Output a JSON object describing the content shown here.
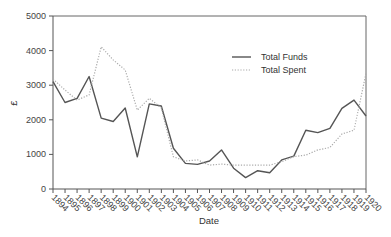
{
  "chart_data": {
    "type": "line",
    "title": "",
    "xlabel": "Date",
    "ylabel": "£",
    "ylim": [
      0,
      5000
    ],
    "yticks": [
      0,
      1000,
      2000,
      3000,
      4000,
      5000
    ],
    "grid": false,
    "legend_position": "upper right (inside)",
    "x": [
      "1894",
      "1895",
      "1896",
      "1897",
      "1898",
      "1899",
      "1900",
      "1901",
      "1902",
      "1903",
      "1904",
      "1905",
      "1906",
      "1907",
      "1908",
      "1909",
      "1910",
      "1911",
      "1912",
      "1913",
      "1914",
      "1915",
      "1916",
      "1917",
      "1918",
      "1919",
      "1920"
    ],
    "series": [
      {
        "name": "Total Funds",
        "style": "solid",
        "color": "#555555",
        "values": [
          3100,
          2500,
          2620,
          3250,
          2050,
          1950,
          2340,
          930,
          2460,
          2400,
          1180,
          740,
          710,
          810,
          1130,
          600,
          330,
          530,
          470,
          840,
          950,
          1700,
          1630,
          1750,
          2330,
          2570,
          2110
        ]
      },
      {
        "name": "Total Spent",
        "style": "dotted",
        "color": "#aaaaaa",
        "values": [
          3180,
          2860,
          2570,
          2720,
          4110,
          3730,
          3440,
          2280,
          2620,
          2340,
          930,
          810,
          840,
          690,
          720,
          690,
          690,
          690,
          690,
          790,
          935,
          980,
          1130,
          1200,
          1590,
          1700,
          3340
        ]
      }
    ]
  }
}
